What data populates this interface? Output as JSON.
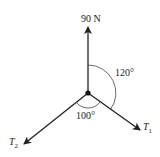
{
  "diagram": {
    "type": "force-diagram",
    "forces": [
      {
        "id": "weight",
        "label": "90 N",
        "direction": "up"
      },
      {
        "id": "T1",
        "symbol": "T",
        "subscript": "1",
        "direction": "down-right"
      },
      {
        "id": "T2",
        "symbol": "T",
        "subscript": "2",
        "direction": "down-left"
      }
    ],
    "angles": [
      {
        "label": "120°",
        "between": [
          "weight",
          "T1"
        ]
      },
      {
        "label": "100°",
        "between": [
          "T2",
          "T1"
        ]
      }
    ]
  }
}
